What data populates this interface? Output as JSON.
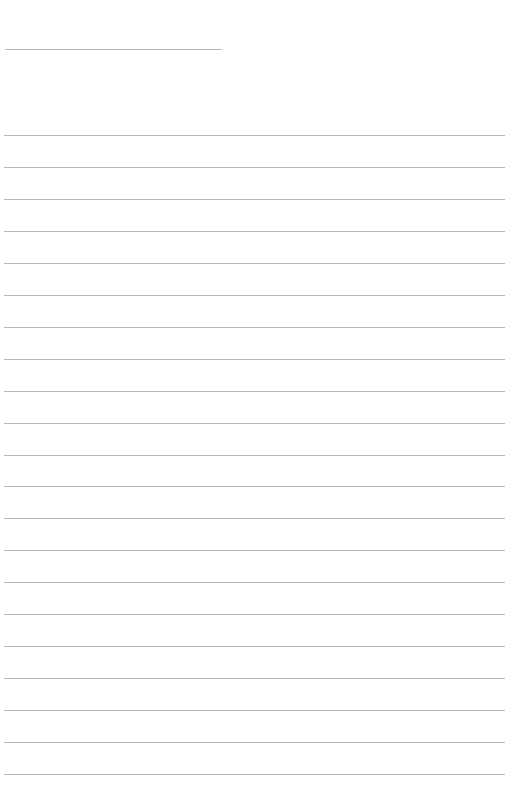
{
  "page": {
    "type": "blank lined sheet",
    "short_line": {
      "top": 49,
      "left": 5,
      "width": 217
    },
    "ruled_lines": {
      "count": 21,
      "first_top": 135,
      "spacing": 32,
      "left": 4,
      "width": 501
    },
    "line_color": "#b8b8b8",
    "background": "#ffffff"
  }
}
